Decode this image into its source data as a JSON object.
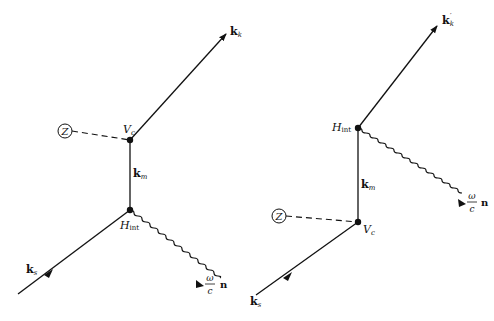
{
  "diagrams": [
    {
      "id": "left",
      "labels": {
        "outgoing": "k",
        "outgoing_sub": "k",
        "vertex_top": "V",
        "vertex_top_sub": "c",
        "intermediate": "k",
        "intermediate_sub": "m",
        "vertex_bottom": "H",
        "vertex_bottom_sub": "int",
        "incoming": "k",
        "incoming_sub": "s",
        "photon_num": "ω",
        "photon_den": "c",
        "photon_vec": "n",
        "nucleus": "Z"
      }
    },
    {
      "id": "right",
      "labels": {
        "outgoing": "k",
        "outgoing_sub": "k",
        "outgoing_sup": "′",
        "vertex_top": "H",
        "vertex_top_sub": "int",
        "intermediate": "k",
        "intermediate_sub": "m",
        "vertex_bottom": "V",
        "vertex_bottom_sub": "c",
        "incoming": "k",
        "incoming_sub": "s",
        "photon_num": "ω",
        "photon_den": "c",
        "photon_vec": "n",
        "nucleus": "Z"
      }
    }
  ],
  "colors": {
    "ink": "#111111",
    "background": "#ffffff"
  }
}
